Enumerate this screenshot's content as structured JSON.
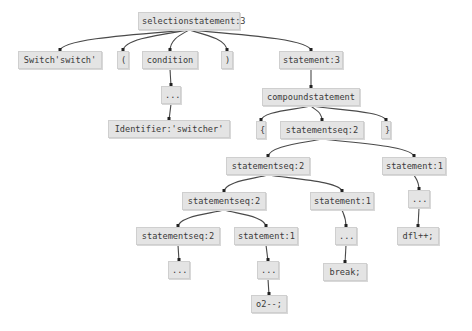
{
  "diagram": {
    "type": "parse-tree",
    "nodes": [
      {
        "id": "n0",
        "label": "selectionstatement:3",
        "x": 138,
        "y": 12,
        "w": 102
      },
      {
        "id": "n1",
        "label": "Switch'switch'",
        "x": 18,
        "y": 51,
        "w": 84
      },
      {
        "id": "n2",
        "label": "(",
        "x": 117,
        "y": 51,
        "w": 12
      },
      {
        "id": "n3",
        "label": "condition",
        "x": 142,
        "y": 51,
        "w": 56
      },
      {
        "id": "n4",
        "label": ")",
        "x": 221,
        "y": 51,
        "w": 12
      },
      {
        "id": "n5",
        "label": "statement:3",
        "x": 279,
        "y": 51,
        "w": 64
      },
      {
        "id": "n6",
        "label": "...",
        "x": 161,
        "y": 86,
        "w": 20
      },
      {
        "id": "n7",
        "label": "compoundstatement",
        "x": 262,
        "y": 88,
        "w": 98
      },
      {
        "id": "n8",
        "label": "Identifier:'switcher'",
        "x": 108,
        "y": 120,
        "w": 122
      },
      {
        "id": "n9",
        "label": "{",
        "x": 256,
        "y": 121,
        "w": 10
      },
      {
        "id": "n10",
        "label": "statementseq:2",
        "x": 280,
        "y": 121,
        "w": 84
      },
      {
        "id": "n11",
        "label": "}",
        "x": 381,
        "y": 121,
        "w": 10
      },
      {
        "id": "n12",
        "label": "statementseq:2",
        "x": 226,
        "y": 157,
        "w": 84
      },
      {
        "id": "n13",
        "label": "statement:1",
        "x": 382,
        "y": 157,
        "w": 64
      },
      {
        "id": "n14",
        "label": "statementseq:2",
        "x": 182,
        "y": 192,
        "w": 84
      },
      {
        "id": "n15",
        "label": "statement:1",
        "x": 310,
        "y": 192,
        "w": 64
      },
      {
        "id": "n16",
        "label": "...",
        "x": 408,
        "y": 190,
        "w": 22
      },
      {
        "id": "n17",
        "label": "statementseq:2",
        "x": 136,
        "y": 227,
        "w": 84
      },
      {
        "id": "n18",
        "label": "statement:1",
        "x": 234,
        "y": 227,
        "w": 64
      },
      {
        "id": "n19",
        "label": "...",
        "x": 335,
        "y": 227,
        "w": 22
      },
      {
        "id": "n20",
        "label": "dfl++;",
        "x": 397,
        "y": 227,
        "w": 42
      },
      {
        "id": "n21",
        "label": "...",
        "x": 168,
        "y": 261,
        "w": 22
      },
      {
        "id": "n22",
        "label": "...",
        "x": 257,
        "y": 261,
        "w": 22
      },
      {
        "id": "n23",
        "label": "break;",
        "x": 323,
        "y": 263,
        "w": 44
      },
      {
        "id": "n24",
        "label": "o2--;",
        "x": 251,
        "y": 295,
        "w": 36
      }
    ],
    "edges": [
      [
        "n0",
        "n1"
      ],
      [
        "n0",
        "n2"
      ],
      [
        "n0",
        "n3"
      ],
      [
        "n0",
        "n4"
      ],
      [
        "n0",
        "n5"
      ],
      [
        "n3",
        "n6"
      ],
      [
        "n6",
        "n8"
      ],
      [
        "n5",
        "n7"
      ],
      [
        "n7",
        "n9"
      ],
      [
        "n7",
        "n10"
      ],
      [
        "n7",
        "n11"
      ],
      [
        "n10",
        "n12"
      ],
      [
        "n10",
        "n13"
      ],
      [
        "n12",
        "n14"
      ],
      [
        "n12",
        "n15"
      ],
      [
        "n13",
        "n16"
      ],
      [
        "n16",
        "n20"
      ],
      [
        "n14",
        "n17"
      ],
      [
        "n14",
        "n18"
      ],
      [
        "n15",
        "n19"
      ],
      [
        "n19",
        "n23"
      ],
      [
        "n17",
        "n21"
      ],
      [
        "n18",
        "n22"
      ],
      [
        "n22",
        "n24"
      ]
    ],
    "colors": {
      "node_fill": "#e4e4e4",
      "node_border": "#cfcfcf",
      "edge": "#4a4a4a",
      "text": "#3a3a3a",
      "background": "#ffffff"
    }
  }
}
